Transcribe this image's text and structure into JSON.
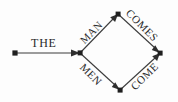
{
  "figure": {
    "background_color": "#fdfdfd",
    "ink_color": "#2e2e2e"
  },
  "nodes": [
    {
      "id": "start",
      "name": "start-node",
      "x": 15,
      "y": 53
    },
    {
      "id": "branch",
      "name": "branch-node",
      "x": 80,
      "y": 53
    },
    {
      "id": "top",
      "name": "top-node",
      "x": 118,
      "y": 14
    },
    {
      "id": "bottom",
      "name": "bottom-node",
      "x": 120,
      "y": 90
    },
    {
      "id": "end",
      "name": "end-node",
      "x": 160,
      "y": 53
    }
  ],
  "edges": [
    {
      "id": "the",
      "label": "THE",
      "from": "start",
      "to": "branch",
      "direction": "right",
      "rotation": 0
    },
    {
      "id": "man",
      "label": "MAN",
      "from": "branch",
      "to": "top",
      "direction": "up-right",
      "rotation": -45
    },
    {
      "id": "men",
      "label": "MEN",
      "from": "branch",
      "to": "bottom",
      "direction": "down-right",
      "rotation": 45
    },
    {
      "id": "comes",
      "label": "COMES",
      "from": "top",
      "to": "end",
      "direction": "down-right",
      "rotation": 45
    },
    {
      "id": "come",
      "label": "COME",
      "from": "bottom",
      "to": "end",
      "direction": "up-right",
      "rotation": -45
    }
  ]
}
